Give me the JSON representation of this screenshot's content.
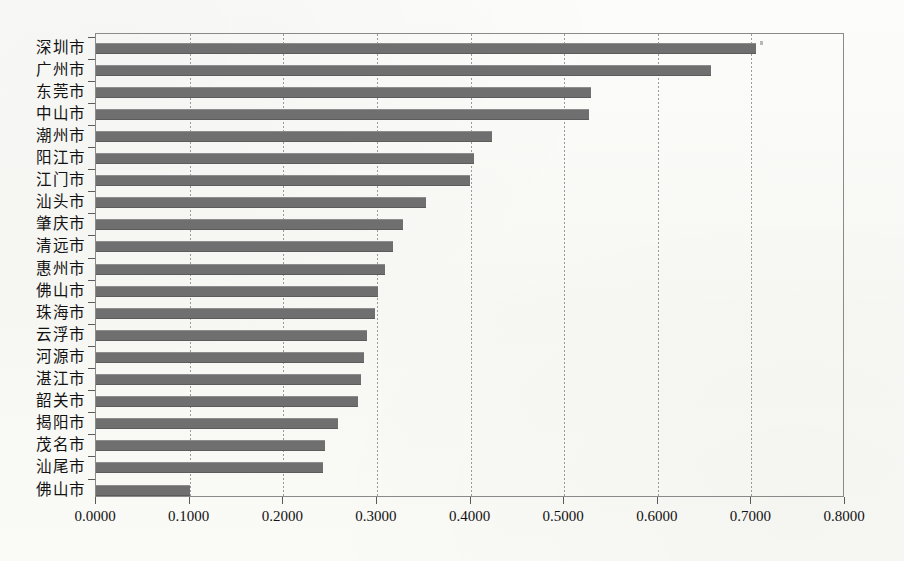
{
  "chart_data": {
    "type": "bar",
    "orientation": "horizontal",
    "title": "",
    "subtitle": "",
    "xlabel": "",
    "ylabel": "",
    "xlim": [
      0.0,
      0.8
    ],
    "xticks": [
      0.0,
      0.1,
      0.2,
      0.3,
      0.4,
      0.5,
      0.6,
      0.7,
      0.8
    ],
    "xtick_labels": [
      "0.0000",
      "0.1000",
      "0.2000",
      "0.3000",
      "0.4000",
      "0.5000",
      "0.6000",
      "0.7000",
      "0.8000"
    ],
    "grid": "vertical",
    "legend": "none",
    "bar_color": "#6f6f6f",
    "categories": [
      "深圳市",
      "广州市",
      "东莞市",
      "中山市",
      "潮州市",
      "阳江市",
      "江门市",
      "汕头市",
      "肇庆市",
      "清远市",
      "惠州市",
      "佛山市",
      "珠海市",
      "云浮市",
      "河源市",
      "湛江市",
      "韶关市",
      "揭阳市",
      "茂名市",
      "汕尾市",
      "佛山市"
    ],
    "values": [
      0.705,
      0.657,
      0.529,
      0.527,
      0.423,
      0.404,
      0.399,
      0.352,
      0.328,
      0.317,
      0.309,
      0.301,
      0.298,
      0.289,
      0.286,
      0.283,
      0.28,
      0.258,
      0.245,
      0.242,
      0.1
    ]
  },
  "figure": {
    "background_color": "#fbfbf9",
    "frame_color": "#8a8a8a",
    "gridline_color": "#9a9a9a",
    "text_color": "#121212"
  }
}
